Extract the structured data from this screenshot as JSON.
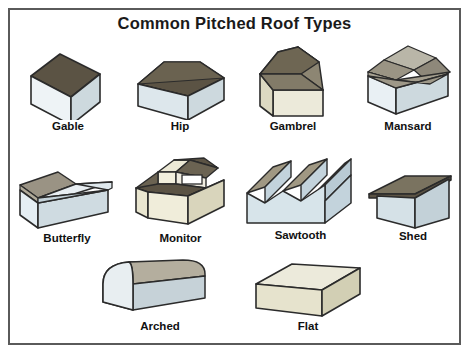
{
  "poster": {
    "title": "Common Pitched Roof Types",
    "border_color": "#5a5a5a",
    "background_color": "#ffffff"
  },
  "palette": {
    "roof_dark": "#5b5344",
    "roof_mid": "#8d8673",
    "roof_tan": "#a59c84",
    "wall_light": "#eef3f6",
    "wall_blue": "#cdd9de",
    "wall_cream": "#ece9d6",
    "wall_cream_dark": "#ddd9bf",
    "glass_blue": "#c3d3dc",
    "outline": "#2b2b2b",
    "label_color": "#111111"
  },
  "rows": [
    {
      "items": [
        {
          "name": "gable",
          "label": "Gable"
        },
        {
          "name": "hip",
          "label": "Hip"
        },
        {
          "name": "gambrel",
          "label": "Gambrel"
        },
        {
          "name": "mansard",
          "label": "Mansard"
        }
      ]
    },
    {
      "items": [
        {
          "name": "butterfly",
          "label": "Butterfly"
        },
        {
          "name": "monitor",
          "label": "Monitor"
        },
        {
          "name": "sawtooth",
          "label": "Sawtooth"
        },
        {
          "name": "shed",
          "label": "Shed"
        }
      ]
    },
    {
      "items": [
        {
          "name": "arched",
          "label": "Arched"
        },
        {
          "name": "flat",
          "label": "Flat"
        }
      ]
    }
  ]
}
